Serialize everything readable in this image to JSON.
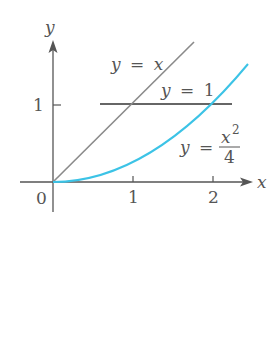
{
  "figure": {
    "axes": {
      "x_label": "x",
      "y_label": "y",
      "origin_label": "0",
      "x_ticks": [
        "1",
        "2"
      ],
      "y_ticks": [
        "1"
      ]
    },
    "curves": [
      {
        "name": "line-y-equals-x",
        "label_lhs": "y",
        "label_eq": "=",
        "label_rhs": "x",
        "color": "#8a8a8a"
      },
      {
        "name": "line-y-equals-1",
        "label_lhs": "y",
        "label_eq": "=",
        "label_rhs": "1",
        "color": "#333333"
      },
      {
        "name": "parabola-y-equals-x2-over-4",
        "label_lhs": "y",
        "label_eq": "=",
        "label_num": "x",
        "label_exp": "2",
        "label_den": "4",
        "color": "#3cc3e6"
      }
    ]
  }
}
